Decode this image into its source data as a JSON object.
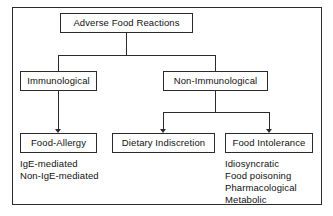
{
  "diagram": {
    "title": "Adverse Food Reactions",
    "type": "hierarchy-tree",
    "border_color": "#2b2b2b",
    "background_color": "#ffffff",
    "nodes": {
      "root": {
        "label": "Adverse Food Reactions"
      },
      "immunological": {
        "label": "Immunological"
      },
      "non_immunological": {
        "label": "Non-Immunological"
      },
      "food_allergy": {
        "label": "Food-Allergy"
      },
      "dietary_indiscretion": {
        "label": "Dietary Indiscretion"
      },
      "food_intolerance": {
        "label": "Food Intolerance"
      }
    },
    "sublists": {
      "food_allergy_items": [
        "IgE-mediated",
        "Non-IgE-mediated"
      ],
      "food_intolerance_items": [
        "Idiosyncratic",
        "Food poisoning",
        "Pharmacological",
        "Metabolic"
      ]
    }
  }
}
